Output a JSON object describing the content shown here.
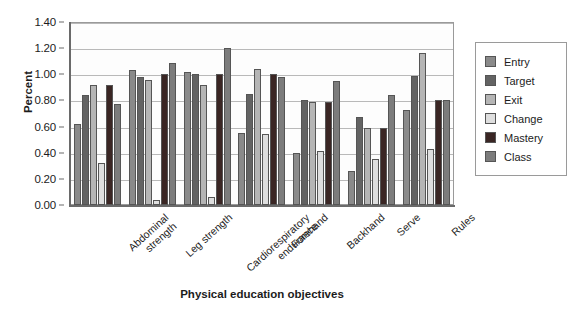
{
  "chart_data": {
    "type": "bar",
    "title": "",
    "xlabel": "Physical education objectives",
    "ylabel": "Percent",
    "ylim": [
      0.0,
      1.4
    ],
    "yticks": [
      "0.00",
      "0.20",
      "0.40",
      "0.60",
      "0.80",
      "1.00",
      "1.20",
      "1.40"
    ],
    "ytick_values": [
      0.0,
      0.2,
      0.4,
      0.6,
      0.8,
      1.0,
      1.2,
      1.4
    ],
    "grid": "horizontal",
    "legend_position": "right",
    "categories": [
      "Abdominal strength",
      "Leg strength",
      "Cardiorespiratory endurance",
      "Forehand",
      "Backhand",
      "Serve",
      "Rules"
    ],
    "series": [
      {
        "name": "Entry",
        "color": "#8a8a8a",
        "values": [
          0.62,
          1.03,
          1.02,
          0.55,
          0.4,
          0.26,
          0.73
        ]
      },
      {
        "name": "Target",
        "color": "#636363",
        "values": [
          0.84,
          0.98,
          1.0,
          0.85,
          0.8,
          0.67,
          0.99
        ]
      },
      {
        "name": "Exit",
        "color": "#b5b5b5",
        "values": [
          0.92,
          0.96,
          0.92,
          1.04,
          0.79,
          0.59,
          1.16
        ]
      },
      {
        "name": "Change",
        "color": "#dedede",
        "values": [
          0.32,
          0.04,
          0.06,
          0.54,
          0.41,
          0.35,
          0.43
        ]
      },
      {
        "name": "Mastery",
        "color": "#3a2624",
        "values": [
          0.92,
          1.0,
          1.0,
          1.0,
          0.79,
          0.59,
          0.8
        ]
      },
      {
        "name": "Class",
        "color": "#7c7c7c",
        "values": [
          0.77,
          1.09,
          1.2,
          0.98,
          0.95,
          0.84,
          0.8
        ]
      }
    ]
  },
  "legend": {
    "items": [
      {
        "label": "Entry"
      },
      {
        "label": "Target"
      },
      {
        "label": "Exit"
      },
      {
        "label": "Change"
      },
      {
        "label": "Mastery"
      },
      {
        "label": "Class"
      }
    ]
  }
}
